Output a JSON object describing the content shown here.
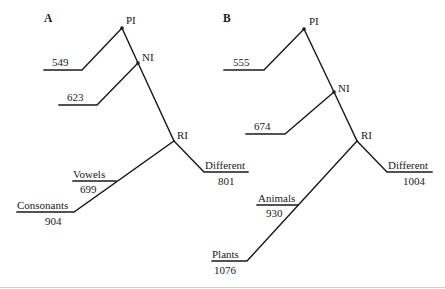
{
  "panels": [
    {
      "label": "A",
      "nodes": {
        "pi": "PI",
        "ni": "NI",
        "ri": "RI"
      },
      "branches": {
        "pi_branch": {
          "value": "549"
        },
        "ni_branch": {
          "value": "623"
        },
        "different": {
          "label": "Different",
          "value": "801"
        },
        "near": {
          "label": "Vowels",
          "value": "699"
        },
        "far": {
          "label": "Consonants",
          "value": "904"
        }
      }
    },
    {
      "label": "B",
      "nodes": {
        "pi": "PI",
        "ni": "NI",
        "ri": "RI"
      },
      "branches": {
        "pi_branch": {
          "value": "555"
        },
        "ni_branch": {
          "value": "674"
        },
        "different": {
          "label": "Different",
          "value": "1004"
        },
        "near": {
          "label": "Animals",
          "value": "930"
        },
        "far": {
          "label": "Plants",
          "value": "1076"
        }
      }
    }
  ]
}
